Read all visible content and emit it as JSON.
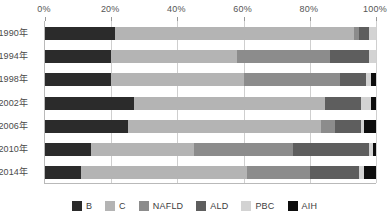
{
  "chart_data": {
    "type": "bar",
    "orientation": "horizontal",
    "stacked": true,
    "normalized_percent": true,
    "title": "",
    "xlabel": "",
    "ylabel": "",
    "xlim": [
      0,
      100
    ],
    "grid": true,
    "legend_position": "bottom",
    "x_tick_labels": [
      "0%",
      "20%",
      "40%",
      "60%",
      "80%",
      "100%"
    ],
    "x_ticks": [
      0,
      20,
      40,
      60,
      80,
      100
    ],
    "categories": [
      "1990年",
      "1994年",
      "1998年",
      "2002年",
      "2006年",
      "2010年",
      "2014年"
    ],
    "series": [
      {
        "name": "B",
        "color": "#2b2b2b",
        "values": [
          21.0,
          20.0,
          20.0,
          27.0,
          25.0,
          14.0,
          11.0
        ]
      },
      {
        "name": "C",
        "color": "#b4b4b4",
        "values": [
          72.5,
          38.0,
          40.0,
          57.5,
          58.5,
          31.0,
          50.0
        ]
      },
      {
        "name": "NAFLD",
        "color": "#8c8c8c",
        "values": [
          1.5,
          28.0,
          29.0,
          0.0,
          4.0,
          30.0,
          19.0
        ]
      },
      {
        "name": "ALD",
        "color": "#5e5e5e",
        "values": [
          3.0,
          12.0,
          8.0,
          11.0,
          8.0,
          23.0,
          15.0
        ]
      },
      {
        "name": "PBC",
        "color": "#d3d3d3",
        "values": [
          2.0,
          2.0,
          1.5,
          3.0,
          1.0,
          1.0,
          1.5
        ]
      },
      {
        "name": "AIH",
        "color": "#0d0d0d",
        "values": [
          0.0,
          0.0,
          1.5,
          1.5,
          3.5,
          1.0,
          3.5
        ]
      }
    ]
  },
  "legend": {
    "items": [
      {
        "label": "B"
      },
      {
        "label": "C"
      },
      {
        "label": "NAFLD"
      },
      {
        "label": "ALD"
      },
      {
        "label": "PBC"
      },
      {
        "label": "AIH"
      }
    ]
  },
  "colors": {
    "axis_line": "#b9b9b9",
    "gridline": "#cfcfcf",
    "tick_text": "#555555",
    "label_text": "#4a4a4a",
    "background": "#ffffff"
  }
}
